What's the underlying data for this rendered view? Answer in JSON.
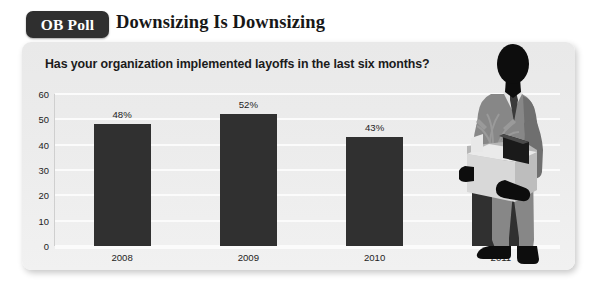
{
  "header": {
    "badge_label": "OB Poll",
    "headline": "Downsizing Is Downsizing"
  },
  "card": {
    "question": "Has your organization implemented layoffs in the last six months?"
  },
  "chart_data": {
    "type": "bar",
    "title": "Downsizing Is Downsizing",
    "subtitle": "Has your organization implemented layoffs in the last six months?",
    "categories": [
      "2008",
      "2009",
      "2010",
      "2011"
    ],
    "values": [
      48,
      52,
      43,
      36
    ],
    "data_labels": [
      "48%",
      "52%",
      "43%",
      "36%"
    ],
    "xlabel": "",
    "ylabel": "",
    "ylim": [
      0,
      60
    ],
    "yticks": [
      0,
      10,
      20,
      30,
      40,
      50,
      60
    ],
    "ytick_labels": [
      "0",
      "10",
      "20",
      "30",
      "40",
      "50",
      "60"
    ],
    "grid": true,
    "legend": "none",
    "bar_color": "#303030",
    "plot_background": "#ececec",
    "gridline_color": "#fbfbfb"
  },
  "illustration": {
    "name": "businessman-carrying-box",
    "description": "Silhouette of a man in a gray suit holding a box with a plant and a folder",
    "colors": {
      "skin_and_shoes": "#0d0d0d",
      "suit": "#878787",
      "suit_shadow": "#6f6f6f",
      "shirt": "#e4e4e4",
      "tie": "#3a3a3a",
      "box": "#d8d8d8",
      "box_shade": "#b6b6b6",
      "folder": "#1a1a1a",
      "plant": "#9a9a9a"
    }
  },
  "theme": {
    "page_background": "#ffffff",
    "badge_background": "#2f2f2f",
    "badge_text": "#ffffff",
    "headline_text": "#171717",
    "card_background": "#ececec"
  }
}
